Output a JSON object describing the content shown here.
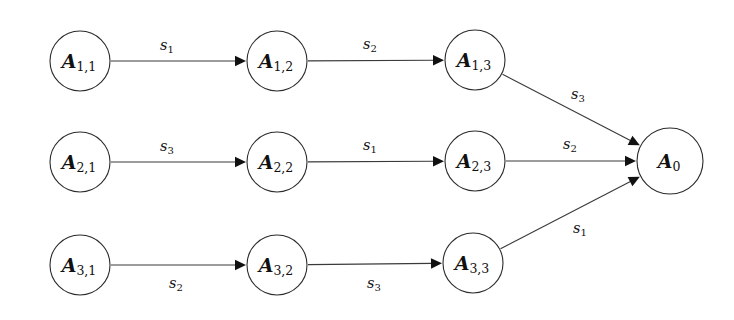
{
  "diagram": {
    "background_color": "#ffffff",
    "stroke_color": "#2b2b2b",
    "text_color": "#111111",
    "nodes": [
      {
        "id": "A11",
        "main": "A",
        "sub": "1,1",
        "cx": 80,
        "cy": 61,
        "r": 30
      },
      {
        "id": "A12",
        "main": "A",
        "sub": "1,2",
        "cx": 277,
        "cy": 61,
        "r": 30
      },
      {
        "id": "A13",
        "main": "A",
        "sub": "1,3",
        "cx": 475,
        "cy": 60,
        "r": 30
      },
      {
        "id": "A21",
        "main": "A",
        "sub": "2,1",
        "cx": 80,
        "cy": 162,
        "r": 30
      },
      {
        "id": "A22",
        "main": "A",
        "sub": "2,2",
        "cx": 277,
        "cy": 162,
        "r": 30
      },
      {
        "id": "A23",
        "main": "A",
        "sub": "2,3",
        "cx": 475,
        "cy": 161,
        "r": 30
      },
      {
        "id": "A31",
        "main": "A",
        "sub": "3,1",
        "cx": 80,
        "cy": 265,
        "r": 30
      },
      {
        "id": "A32",
        "main": "A",
        "sub": "3,2",
        "cx": 277,
        "cy": 265,
        "r": 30
      },
      {
        "id": "A33",
        "main": "A",
        "sub": "3,3",
        "cx": 473,
        "cy": 263,
        "r": 30
      },
      {
        "id": "A0",
        "main": "A",
        "sub": "0",
        "cx": 670,
        "cy": 161,
        "r": 33
      }
    ],
    "edges": [
      {
        "id": "e-A11-A12",
        "from": "A11",
        "to": "A12",
        "main": "s",
        "sub": "1",
        "lx": 167,
        "ly": 45
      },
      {
        "id": "e-A12-A13",
        "from": "A12",
        "to": "A13",
        "main": "s",
        "sub": "2",
        "lx": 370,
        "ly": 44
      },
      {
        "id": "e-A13-A0",
        "from": "A13",
        "to": "A0",
        "main": "s",
        "sub": "3",
        "lx": 578,
        "ly": 94
      },
      {
        "id": "e-A21-A22",
        "from": "A21",
        "to": "A22",
        "main": "s",
        "sub": "3",
        "lx": 167,
        "ly": 146
      },
      {
        "id": "e-A22-A23",
        "from": "A22",
        "to": "A23",
        "main": "s",
        "sub": "1",
        "lx": 370,
        "ly": 145
      },
      {
        "id": "e-A23-A0",
        "from": "A23",
        "to": "A0",
        "main": "s",
        "sub": "2",
        "lx": 570,
        "ly": 144
      },
      {
        "id": "e-A31-A32",
        "from": "A31",
        "to": "A32",
        "main": "s",
        "sub": "2",
        "lx": 176,
        "ly": 283
      },
      {
        "id": "e-A32-A33",
        "from": "A32",
        "to": "A33",
        "main": "s",
        "sub": "3",
        "lx": 374,
        "ly": 283
      },
      {
        "id": "e-A33-A0",
        "from": "A33",
        "to": "A0",
        "main": "s",
        "sub": "1",
        "lx": 580,
        "ly": 228
      }
    ]
  }
}
